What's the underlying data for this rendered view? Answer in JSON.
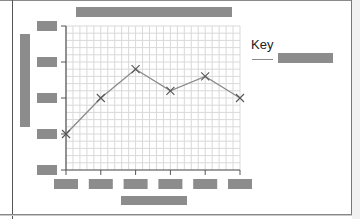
{
  "chart_data": {
    "type": "line",
    "xlabel": "[redacted]",
    "ylabel": "[redacted]",
    "categories": [
      "[redacted]",
      "[redacted]",
      "[redacted]",
      "[redacted]",
      "[redacted]",
      "[redacted]"
    ],
    "y_ticks": [
      "[redacted]",
      "[redacted]",
      "[redacted]",
      "[redacted]",
      "[redacted]"
    ],
    "ylim": [
      0,
      4
    ],
    "grid": true,
    "marker": "x",
    "legend": {
      "title": "Key",
      "placement": "right",
      "entries": [
        "[redacted]"
      ]
    },
    "series": [
      {
        "name": "[redacted]",
        "color": "#8a8a8a",
        "values": [
          1.0,
          2.0,
          2.8,
          2.2,
          2.6,
          2.0
        ]
      }
    ],
    "note": "All axis/tick/legend text is redacted (gray boxes); values are in tick-index units (bottom tick = 0, top tick = 4)."
  },
  "colors": {
    "redaction": "#8c8c8c",
    "line": "#8a8a8a",
    "grid": "#d9d9d9",
    "axis": "#555555"
  }
}
